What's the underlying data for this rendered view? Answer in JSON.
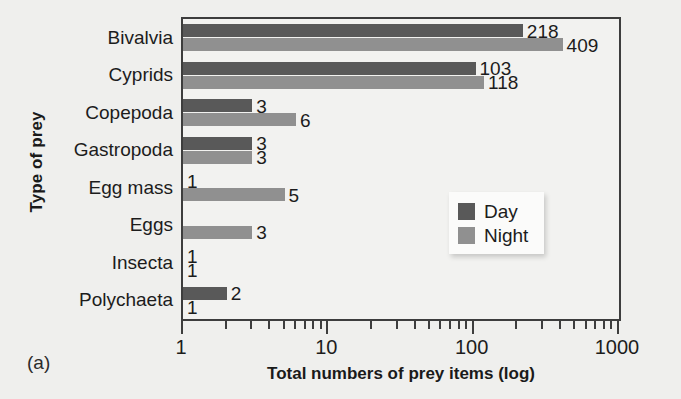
{
  "panel_label": "(a)",
  "legend": {
    "items": [
      {
        "label": "Day",
        "color": "#595959"
      },
      {
        "label": "Night",
        "color": "#909090"
      }
    ]
  },
  "chart_data": {
    "type": "bar",
    "orientation": "horizontal",
    "title": "",
    "xlabel": "Total numbers of prey items (log)",
    "ylabel": "Type of prey",
    "xscale": "log",
    "xlim": [
      1,
      1000
    ],
    "xticks": [
      1,
      10,
      100,
      1000
    ],
    "xtick_labels": [
      "1",
      "10",
      "100",
      "1000"
    ],
    "grid": false,
    "legend_position": "center-right",
    "categories": [
      "Bivalvia",
      "Cyprids",
      "Copepoda",
      "Gastropoda",
      "Egg mass",
      "Eggs",
      "Insecta",
      "Polychaeta"
    ],
    "series": [
      {
        "name": "Day",
        "color": "#595959",
        "values": [
          218,
          103,
          3,
          3,
          1,
          null,
          1,
          2
        ],
        "value_labels": [
          "218",
          "103",
          "3",
          "3",
          "1",
          "",
          "1",
          "2"
        ]
      },
      {
        "name": "Night",
        "color": "#909090",
        "values": [
          409,
          118,
          6,
          3,
          5,
          3,
          1,
          1
        ],
        "value_labels": [
          "409",
          "118",
          "6",
          "3",
          "5",
          "3",
          "1",
          "1"
        ]
      }
    ]
  }
}
